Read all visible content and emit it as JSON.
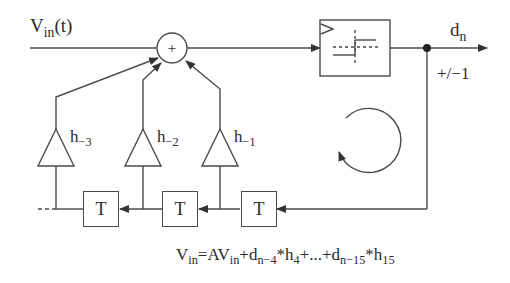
{
  "diagram": {
    "type": "DFE feedback loop block diagram",
    "input_label": {
      "main": "V",
      "sub": "in",
      "tail": "(t)"
    },
    "summer_symbol": "+",
    "comparator": {
      "name": "slicer",
      "icon": "comparator-step-icon"
    },
    "output_label": {
      "main": "d",
      "sub": "n"
    },
    "output_levels": "+/−1",
    "taps": [
      {
        "main": "h",
        "sub": "−3"
      },
      {
        "main": "h",
        "sub": "−2"
      },
      {
        "main": "h",
        "sub": "−1"
      }
    ],
    "delays": [
      "T",
      "T",
      "T"
    ],
    "equation": {
      "parts": [
        {
          "t": "V"
        },
        {
          "s": "in"
        },
        {
          "t": "=AV"
        },
        {
          "s": "in"
        },
        {
          "t": "+d"
        },
        {
          "s": "n−4"
        },
        {
          "t": "*h"
        },
        {
          "s": "4"
        },
        {
          "t": "+...+d"
        },
        {
          "s": "n−15"
        },
        {
          "t": "*h"
        },
        {
          "s": "15"
        }
      ]
    },
    "colors": {
      "stroke": "#4a4a4a",
      "text": "#2b2b2b",
      "background": "#ffffff"
    }
  }
}
